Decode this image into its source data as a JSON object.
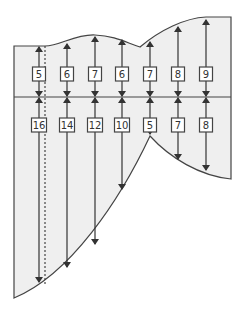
{
  "diagram": {
    "type": "region-with-vertical-segments",
    "colors": {
      "fill": "#efefef",
      "stroke": "#444444",
      "arrow": "#333333",
      "box_fill": "#ffffff"
    },
    "midline_y": 97,
    "top_labels": [
      "5",
      "6",
      "7",
      "6",
      "7",
      "8",
      "9"
    ],
    "bottom_labels": [
      "16",
      "14",
      "12",
      "10",
      "5",
      "7",
      "8"
    ],
    "columns": [
      {
        "x": 39,
        "top_y": 46,
        "bottom_y": 283,
        "top_label": "5",
        "bottom_label": "16"
      },
      {
        "x": 67,
        "top_y": 43,
        "bottom_y": 268,
        "top_label": "6",
        "bottom_label": "14"
      },
      {
        "x": 95,
        "top_y": 36,
        "bottom_y": 245,
        "top_label": "7",
        "bottom_label": "12"
      },
      {
        "x": 122,
        "top_y": 39,
        "bottom_y": 190,
        "top_label": "6",
        "bottom_label": "10"
      },
      {
        "x": 150,
        "top_y": 41,
        "bottom_y": 135,
        "top_label": "7",
        "bottom_label": "5"
      },
      {
        "x": 178,
        "top_y": 26,
        "bottom_y": 160,
        "top_label": "8",
        "bottom_label": "7"
      },
      {
        "x": 206,
        "top_y": 19,
        "bottom_y": 171,
        "top_label": "9",
        "bottom_label": "8"
      }
    ],
    "dashed_line_x": 45
  }
}
